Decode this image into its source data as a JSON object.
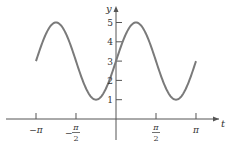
{
  "chart_data": {
    "type": "line",
    "title": "",
    "xlabel": "t",
    "ylabel": "y",
    "function": "y = 3 + 2 sin(2t)",
    "xlim": [
      -3.14159,
      3.14159
    ],
    "ylim": [
      0,
      5
    ],
    "x_ticks": [
      {
        "value": -3.14159,
        "label": "−π"
      },
      {
        "value": -1.5708,
        "label": "−π/2"
      },
      {
        "value": 1.5708,
        "label": "π/2"
      },
      {
        "value": 3.14159,
        "label": "π"
      }
    ],
    "y_ticks": [
      {
        "value": 1,
        "label": "1"
      },
      {
        "value": 2,
        "label": "2"
      },
      {
        "value": 3,
        "label": "3"
      },
      {
        "value": 4,
        "label": "4"
      },
      {
        "value": 5,
        "label": "5"
      }
    ],
    "series": [
      {
        "name": "y(t)",
        "color": "#7a7a7a",
        "x": [
          -3.14159,
          -2.35619,
          -1.5708,
          -0.7854,
          0,
          0.7854,
          1.5708,
          2.35619,
          3.14159
        ],
        "values": [
          3,
          5,
          3,
          1,
          3,
          5,
          3,
          1,
          3
        ]
      }
    ],
    "grid": false,
    "legend": null
  },
  "axes": {
    "x_label": "t",
    "y_label": "y"
  }
}
